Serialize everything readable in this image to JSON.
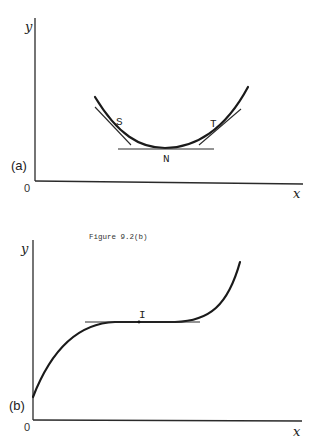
{
  "panels": [
    {
      "id": "a",
      "panel_label": "(a)",
      "x_axis_label": "x",
      "y_axis_label": "y",
      "origin_label": "0",
      "points": {
        "s": "S",
        "t": "T",
        "n": "N"
      },
      "description": "U-shaped curve with minimum at N (horizontal tangent); tangents at S and T"
    },
    {
      "id": "b",
      "caption": "Figure 9.2(b)",
      "panel_label": "(b)",
      "x_axis_label": "x",
      "y_axis_label": "y",
      "origin_label": "0",
      "points": {
        "i": "I"
      },
      "description": "Increasing curve with stationary point of inflection at I (horizontal tangent)"
    }
  ]
}
